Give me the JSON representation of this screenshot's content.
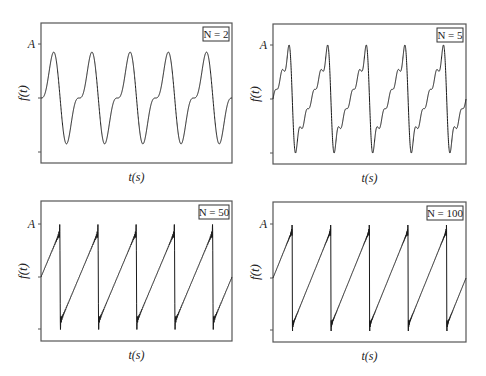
{
  "figure": {
    "line_color": "#1a1a1a",
    "frame_color": "#555555"
  },
  "chart_data": [
    {
      "type": "line",
      "title": "N = 2",
      "legend_label": "N = 2",
      "N": 2,
      "xlabel": "t(s)",
      "ylabel": "f(t)",
      "ytick_labels": [
        "A",
        "",
        ""
      ],
      "periods_shown": 5,
      "waveform": "sawtooth partial sum",
      "grid": false,
      "legend_position": "upper right",
      "frame": {
        "x0": 41,
        "y0": 23,
        "x1": 232,
        "y1": 163
      },
      "yticks_px": {
        "A": 44,
        "mid": 98,
        "low": 152
      }
    },
    {
      "type": "line",
      "title": "N = 5",
      "legend_label": "N = 5",
      "N": 5,
      "xlabel": "t(s)",
      "ylabel": "f(t)",
      "ytick_labels": [
        "A",
        "",
        ""
      ],
      "periods_shown": 5,
      "waveform": "sawtooth partial sum",
      "grid": false,
      "legend_position": "upper right",
      "frame": {
        "x0": 273,
        "y0": 24,
        "x1": 466,
        "y1": 164
      },
      "yticks_px": {
        "A": 45,
        "mid": 99,
        "low": 153
      }
    },
    {
      "type": "line",
      "title": "N = 50",
      "legend_label": "N = 50",
      "N": 50,
      "xlabel": "t(s)",
      "ylabel": "f(t)",
      "ytick_labels": [
        "A",
        "",
        ""
      ],
      "periods_shown": 5,
      "waveform": "sawtooth partial sum",
      "grid": false,
      "legend_position": "upper right",
      "frame": {
        "x0": 41,
        "y0": 201,
        "x1": 232,
        "y1": 341
      },
      "yticks_px": {
        "A": 224,
        "mid": 277,
        "low": 329
      }
    },
    {
      "type": "line",
      "title": "N = 100",
      "legend_label": "N = 100",
      "N": 100,
      "xlabel": "t(s)",
      "ylabel": "f(t)",
      "ytick_labels": [
        "A",
        "",
        ""
      ],
      "periods_shown": 5,
      "waveform": "sawtooth partial sum",
      "grid": false,
      "legend_position": "upper right",
      "frame": {
        "x0": 273,
        "y0": 202,
        "x1": 466,
        "y1": 342
      },
      "yticks_px": {
        "A": 224,
        "mid": 278,
        "low": 330
      }
    }
  ],
  "panels": [
    {
      "legend": "N = 2",
      "xlabel": "t(s)",
      "ylabel": "f(t)",
      "ytick_top": "A"
    },
    {
      "legend": "N = 5",
      "xlabel": "t(s)",
      "ylabel": "f(t)",
      "ytick_top": "A"
    },
    {
      "legend": "N = 50",
      "xlabel": "t(s)",
      "ylabel": "f(t)",
      "ytick_top": "A"
    },
    {
      "legend": "N = 100",
      "xlabel": "t(s)",
      "ylabel": "f(t)",
      "ytick_top": "A"
    }
  ]
}
